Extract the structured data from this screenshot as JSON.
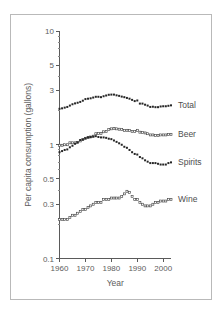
{
  "chart_data": {
    "type": "line",
    "title": "",
    "subtitle": "",
    "xlabel": "Year",
    "ylabel": "Per capita consumption (gallons)",
    "yscale": "log",
    "ylim": [
      0.1,
      10
    ],
    "xlim": [
      1960,
      2003
    ],
    "grid": false,
    "legend_position": "right-inline",
    "y_ticks": [
      {
        "value": 10,
        "label": "10"
      },
      {
        "value": 5,
        "label": "5"
      },
      {
        "value": 3,
        "label": "3"
      },
      {
        "value": 1,
        "label": "1"
      },
      {
        "value": 0.5,
        "label": "0.5"
      },
      {
        "value": 0.3,
        "label": "0.3"
      },
      {
        "value": 0.1,
        "label": "0.1"
      }
    ],
    "y_minor_ticks": [
      9,
      8,
      7,
      6,
      4,
      2,
      0.9,
      0.8,
      0.7,
      0.6,
      0.4,
      0.2
    ],
    "x_ticks": [
      {
        "value": 1960,
        "label": "1960"
      },
      {
        "value": 1970,
        "label": "1970"
      },
      {
        "value": 1980,
        "label": "1980"
      },
      {
        "value": 1990,
        "label": "1990"
      },
      {
        "value": 2000,
        "label": "2000"
      }
    ],
    "x": [
      1960,
      1961,
      1962,
      1963,
      1964,
      1965,
      1966,
      1967,
      1968,
      1969,
      1970,
      1971,
      1972,
      1973,
      1974,
      1975,
      1976,
      1977,
      1978,
      1979,
      1980,
      1981,
      1982,
      1983,
      1984,
      1985,
      1986,
      1987,
      1988,
      1989,
      1990,
      1991,
      1992,
      1993,
      1994,
      1995,
      1996,
      1997,
      1998,
      1999,
      2000,
      2001,
      2002,
      2003
    ],
    "series": [
      {
        "name": "Total",
        "marker": "filled-square",
        "label": "Total",
        "values": [
          2.07,
          2.09,
          2.12,
          2.15,
          2.21,
          2.27,
          2.31,
          2.34,
          2.38,
          2.44,
          2.52,
          2.54,
          2.56,
          2.6,
          2.64,
          2.64,
          2.62,
          2.67,
          2.71,
          2.75,
          2.76,
          2.76,
          2.72,
          2.69,
          2.65,
          2.62,
          2.58,
          2.54,
          2.48,
          2.42,
          2.45,
          2.3,
          2.3,
          2.25,
          2.21,
          2.15,
          2.16,
          2.14,
          2.14,
          2.17,
          2.18,
          2.18,
          2.2,
          2.22
        ]
      },
      {
        "name": "Beer",
        "marker": "open-square",
        "label": "Beer",
        "values": [
          0.99,
          0.99,
          1.0,
          1.0,
          1.04,
          1.04,
          1.04,
          1.05,
          1.08,
          1.11,
          1.14,
          1.16,
          1.17,
          1.19,
          1.25,
          1.26,
          1.26,
          1.3,
          1.31,
          1.36,
          1.38,
          1.39,
          1.38,
          1.37,
          1.36,
          1.33,
          1.34,
          1.33,
          1.31,
          1.31,
          1.34,
          1.29,
          1.28,
          1.27,
          1.25,
          1.22,
          1.22,
          1.21,
          1.21,
          1.22,
          1.22,
          1.22,
          1.23,
          1.23
        ]
      },
      {
        "name": "Spirits",
        "marker": "filled-square",
        "label": "Spirits",
        "values": [
          0.86,
          0.88,
          0.9,
          0.91,
          0.95,
          0.98,
          1.02,
          1.05,
          1.1,
          1.11,
          1.14,
          1.16,
          1.17,
          1.18,
          1.19,
          1.17,
          1.16,
          1.16,
          1.15,
          1.13,
          1.12,
          1.09,
          1.06,
          1.03,
          1.0,
          0.96,
          0.94,
          0.9,
          0.86,
          0.83,
          0.82,
          0.78,
          0.76,
          0.73,
          0.71,
          0.69,
          0.69,
          0.69,
          0.68,
          0.67,
          0.67,
          0.67,
          0.69,
          0.7
        ]
      },
      {
        "name": "Wine",
        "marker": "open-square",
        "label": "Wine",
        "values": [
          0.22,
          0.22,
          0.22,
          0.22,
          0.23,
          0.24,
          0.24,
          0.25,
          0.26,
          0.27,
          0.27,
          0.28,
          0.29,
          0.3,
          0.31,
          0.31,
          0.31,
          0.33,
          0.33,
          0.33,
          0.34,
          0.34,
          0.34,
          0.34,
          0.35,
          0.37,
          0.39,
          0.38,
          0.35,
          0.33,
          0.33,
          0.31,
          0.3,
          0.29,
          0.29,
          0.29,
          0.3,
          0.31,
          0.31,
          0.32,
          0.32,
          0.32,
          0.33,
          0.33
        ]
      }
    ]
  }
}
